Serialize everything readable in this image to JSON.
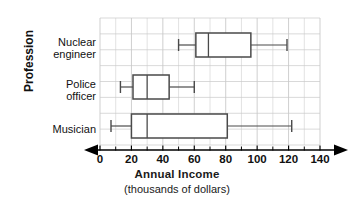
{
  "chart_data": {
    "type": "box",
    "title": "",
    "xlabel": "Annual Income",
    "xlabel_sub": "(thousands of dollars)",
    "ylabel": "Profession",
    "xlim": [
      0,
      140
    ],
    "xticks": [
      0,
      20,
      40,
      60,
      80,
      100,
      120,
      140
    ],
    "xtick_labels": [
      "0",
      "20",
      "40",
      "60",
      "80",
      "100",
      "120",
      "140"
    ],
    "minor_tick_step": 10,
    "grid": true,
    "grid_color": "#c9c9c9",
    "box_color": "#4a4a4a",
    "fill_color": "#ffffff",
    "legend": "none",
    "categories": [
      "Nuclear engineer",
      "Police officer",
      "Musician"
    ],
    "category_labels": [
      [
        "Nuclear",
        "engineer"
      ],
      [
        "Police",
        "officer"
      ],
      [
        "Musician"
      ]
    ],
    "series": [
      {
        "name": "Nuclear engineer",
        "min": 50,
        "q1": 61,
        "median": 69,
        "q3": 96,
        "max": 119
      },
      {
        "name": "Police officer",
        "min": 13,
        "q1": 21,
        "median": 30,
        "q3": 44,
        "max": 60
      },
      {
        "name": "Musician",
        "min": 7,
        "q1": 20,
        "median": 30,
        "q3": 81,
        "max": 122
      }
    ]
  }
}
